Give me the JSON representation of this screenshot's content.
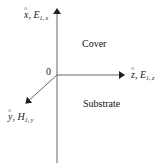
{
  "diagram": {
    "origin_label": "0",
    "axes": {
      "x": {
        "unit_vector": "x",
        "field": "E",
        "subscript": "1, x",
        "direction": "up"
      },
      "z": {
        "unit_vector": "z",
        "field": "E",
        "subscript": "1, z",
        "direction": "right"
      },
      "y": {
        "unit_vector": "y",
        "field": "H",
        "subscript": "1, y",
        "direction": "down-left"
      }
    },
    "regions": {
      "upper": "Cover",
      "lower": "Substrate"
    },
    "colors": {
      "line": "#555555",
      "text": "#222222"
    }
  }
}
